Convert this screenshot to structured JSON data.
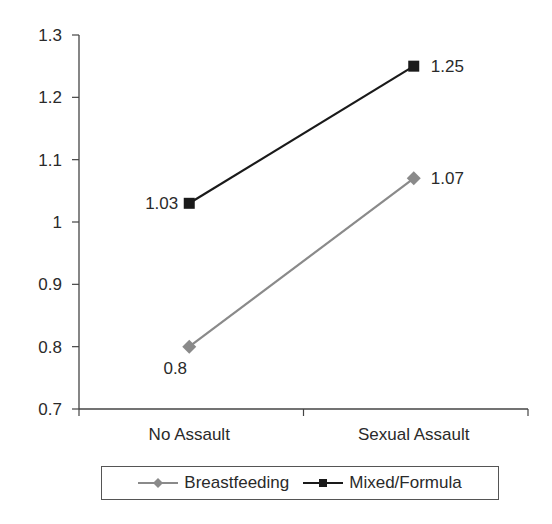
{
  "chart_data": {
    "type": "line",
    "title": "",
    "xlabel": "",
    "ylabel": "",
    "categories": [
      "No Assault",
      "Sexual Assault"
    ],
    "series": [
      {
        "name": "Breastfeeding",
        "values": [
          0.8,
          1.07
        ],
        "color": "#8a8a8a",
        "marker": "diamond"
      },
      {
        "name": "Mixed/Formula",
        "values": [
          1.03,
          1.25
        ],
        "color": "#1a1a1a",
        "marker": "square"
      }
    ],
    "data_labels": {
      "Breastfeeding": [
        "0.8",
        "1.07"
      ],
      "Mixed/Formula": [
        "1.03",
        "1.25"
      ]
    },
    "ylim": [
      0.7,
      1.3
    ],
    "yticks": [
      "0.7",
      "0.8",
      "0.9",
      "1",
      "1.1",
      "1.2",
      "1.3"
    ],
    "grid": false,
    "legend_position": "bottom"
  },
  "legend": {
    "items": [
      {
        "label": "Breastfeeding"
      },
      {
        "label": "Mixed/Formula"
      }
    ]
  }
}
